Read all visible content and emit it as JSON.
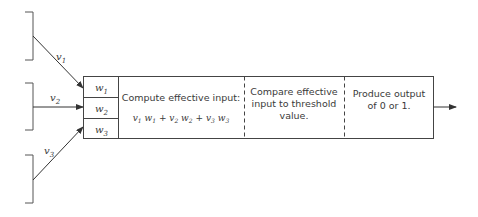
{
  "diagram": {
    "inputs": [
      {
        "label": "v",
        "sub": "1"
      },
      {
        "label": "v",
        "sub": "2"
      },
      {
        "label": "v",
        "sub": "3"
      }
    ],
    "weights": [
      {
        "label": "w",
        "sub": "1"
      },
      {
        "label": "w",
        "sub": "2"
      },
      {
        "label": "w",
        "sub": "3"
      }
    ],
    "stages": [
      {
        "lines": [
          "Compute effective input:"
        ],
        "formula": "v1w1 + v2w2 + v3w3"
      },
      {
        "lines": [
          "Compare effective",
          "input to threshold",
          "value."
        ]
      },
      {
        "lines": [
          "Produce output",
          "of 0 or 1."
        ]
      }
    ],
    "colors": {
      "stroke": "#4a4a4a",
      "text": "#3a3a3a"
    }
  }
}
